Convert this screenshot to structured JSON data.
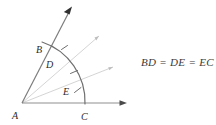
{
  "figure": {
    "background_color": "#ffffff",
    "stroke_dark": "#3a3a3a",
    "stroke_mid": "#8a8a8a",
    "stroke_faint": "#c9c9c9",
    "text_color": "#2b2b2b",
    "labels": {
      "a": "A",
      "b": "B",
      "c": "C",
      "d": "D",
      "e": "E"
    },
    "equation": "BD = DE = EC",
    "points": {
      "a": {
        "x": 22,
        "y": 103
      },
      "b": {
        "x": 48,
        "y": 44
      },
      "c": {
        "x": 85,
        "y": 103
      },
      "d": {
        "x": 60,
        "y": 58
      },
      "e": {
        "x": 78,
        "y": 86
      }
    },
    "label_positions": {
      "a": {
        "x": 14,
        "y": 118
      },
      "b": {
        "x": 37,
        "y": 52
      },
      "c": {
        "x": 81,
        "y": 119
      },
      "d": {
        "x": 47,
        "y": 66
      },
      "e": {
        "x": 64,
        "y": 95
      }
    },
    "rays": [
      {
        "name": "ray-ab-arrow",
        "from": "A",
        "to_x": 72,
        "to_y": 8,
        "weight": "dark"
      },
      {
        "name": "ray-ac-arrow",
        "from": "A",
        "to_x": 128,
        "to_y": 103,
        "weight": "mid"
      },
      {
        "name": "ray-ad-arrow",
        "from": "A",
        "to_x": 99,
        "to_y": 35,
        "weight": "faint"
      },
      {
        "name": "ray-ae-arrow",
        "from": "A",
        "to_x": 113,
        "to_y": 66,
        "weight": "faint"
      }
    ],
    "arc": {
      "name": "arc-bc",
      "center": "A",
      "radius": 64,
      "from": "B",
      "to": "C"
    },
    "tick_marks": [
      {
        "name": "tick-bd",
        "x": 55,
        "y": 51
      },
      {
        "name": "tick-de",
        "x": 69,
        "y": 71
      },
      {
        "name": "tick-ec",
        "x": 80,
        "y": 94
      }
    ]
  }
}
